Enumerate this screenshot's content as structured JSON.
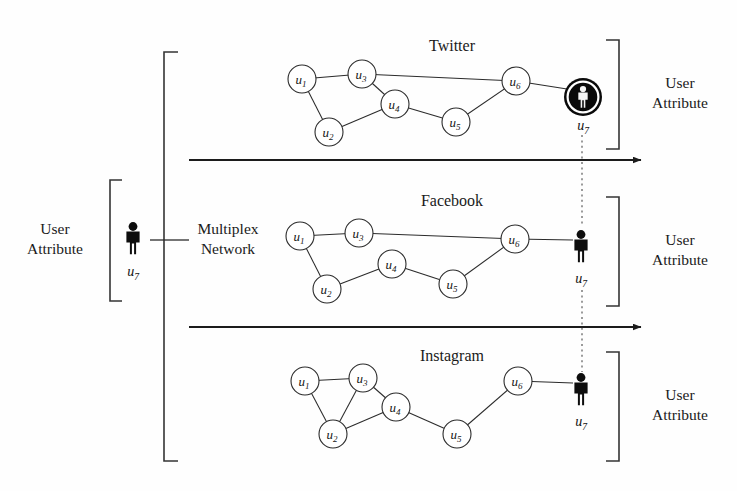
{
  "figure": {
    "kind": "multiplex-network-diagram",
    "background_color": "#fefefe",
    "ink_color": "#1a1a1a"
  },
  "left_annotation": {
    "label_line1": "User",
    "label_line2": "Attribute",
    "person_label": "u",
    "person_subscript": "7",
    "bracket": {
      "x": 110,
      "top": 180,
      "bottom": 301,
      "tip": 12,
      "opens": "right"
    }
  },
  "multiplex_annotation": {
    "label_line1": "Multiplex",
    "label_line2": "Network",
    "bracket": {
      "x": 164,
      "top": 52,
      "bottom": 461,
      "tip": 14,
      "opens": "right"
    },
    "connector": {
      "x1": 164,
      "x2": 189,
      "y": 240
    }
  },
  "layers": [
    {
      "name": "twitter",
      "title": "Twitter",
      "title_pos": {
        "x": 452,
        "y": 51
      },
      "nodes": [
        {
          "id": "u1",
          "label": "u",
          "sub": "1",
          "x": 302,
          "y": 79,
          "r": 14
        },
        {
          "id": "u2",
          "label": "u",
          "sub": "2",
          "x": 329,
          "y": 132,
          "r": 14
        },
        {
          "id": "u3",
          "label": "u",
          "sub": "3",
          "x": 362,
          "y": 74,
          "r": 14
        },
        {
          "id": "u4",
          "label": "u",
          "sub": "4",
          "x": 395,
          "y": 104,
          "r": 14
        },
        {
          "id": "u5",
          "label": "u",
          "sub": "5",
          "x": 456,
          "y": 122,
          "r": 14
        },
        {
          "id": "u6",
          "label": "u",
          "sub": "6",
          "x": 516,
          "y": 81,
          "r": 14
        }
      ],
      "edges": [
        [
          "u1",
          "u3"
        ],
        [
          "u1",
          "u2"
        ],
        [
          "u3",
          "u4"
        ],
        [
          "u3",
          "u6"
        ],
        [
          "u2",
          "u4"
        ],
        [
          "u4",
          "u5"
        ],
        [
          "u5",
          "u6"
        ]
      ],
      "person": {
        "x": 583,
        "y": 97,
        "style": "highlighted-disc",
        "label": "u",
        "subscript": "7",
        "label_y": 130,
        "edge_from": "u6"
      },
      "right_bracket": {
        "x": 619,
        "top": 40,
        "bottom": 149,
        "tip": 13,
        "opens": "left"
      },
      "right_label_line1": "User",
      "right_label_line2": "Attribute",
      "right_label_pos": {
        "x": 680,
        "y": 88
      }
    },
    {
      "name": "facebook",
      "title": "Facebook",
      "title_pos": {
        "x": 452,
        "y": 206
      },
      "nodes": [
        {
          "id": "u1",
          "label": "u",
          "sub": "1",
          "x": 300,
          "y": 236,
          "r": 14
        },
        {
          "id": "u2",
          "label": "u",
          "sub": "2",
          "x": 327,
          "y": 289,
          "r": 14
        },
        {
          "id": "u3",
          "label": "u",
          "sub": "3",
          "x": 359,
          "y": 233,
          "r": 14
        },
        {
          "id": "u4",
          "label": "u",
          "sub": "4",
          "x": 392,
          "y": 264,
          "r": 14
        },
        {
          "id": "u5",
          "label": "u",
          "sub": "5",
          "x": 453,
          "y": 284,
          "r": 14
        },
        {
          "id": "u6",
          "label": "u",
          "sub": "6",
          "x": 515,
          "y": 239,
          "r": 14
        }
      ],
      "edges": [
        [
          "u1",
          "u3"
        ],
        [
          "u1",
          "u2"
        ],
        [
          "u3",
          "u6"
        ],
        [
          "u2",
          "u4"
        ],
        [
          "u4",
          "u5"
        ],
        [
          "u5",
          "u6"
        ]
      ],
      "person": {
        "x": 581,
        "y": 248,
        "style": "silhouette",
        "label": "u",
        "subscript": "7",
        "label_y": 283,
        "edge_from": "u6"
      },
      "right_bracket": {
        "x": 619,
        "top": 197,
        "bottom": 306,
        "tip": 13,
        "opens": "left"
      },
      "right_label_line1": "User",
      "right_label_line2": "Attribute",
      "right_label_pos": {
        "x": 680,
        "y": 245
      }
    },
    {
      "name": "instagram",
      "title": "Instagram",
      "title_pos": {
        "x": 452,
        "y": 361
      },
      "nodes": [
        {
          "id": "u1",
          "label": "u",
          "sub": "1",
          "x": 305,
          "y": 381,
          "r": 14
        },
        {
          "id": "u2",
          "label": "u",
          "sub": "2",
          "x": 333,
          "y": 434,
          "r": 14
        },
        {
          "id": "u3",
          "label": "u",
          "sub": "3",
          "x": 363,
          "y": 378,
          "r": 14
        },
        {
          "id": "u4",
          "label": "u",
          "sub": "4",
          "x": 396,
          "y": 407,
          "r": 14
        },
        {
          "id": "u5",
          "label": "u",
          "sub": "5",
          "x": 457,
          "y": 434,
          "r": 14
        },
        {
          "id": "u6",
          "label": "u",
          "sub": "6",
          "x": 518,
          "y": 381,
          "r": 14
        }
      ],
      "edges": [
        [
          "u1",
          "u3"
        ],
        [
          "u1",
          "u2"
        ],
        [
          "u3",
          "u2"
        ],
        [
          "u3",
          "u4"
        ],
        [
          "u2",
          "u4"
        ],
        [
          "u4",
          "u5"
        ],
        [
          "u5",
          "u6"
        ]
      ],
      "person": {
        "x": 581,
        "y": 391,
        "style": "silhouette",
        "label": "u",
        "subscript": "7",
        "label_y": 426,
        "edge_from": "u6"
      },
      "right_bracket": {
        "x": 619,
        "top": 352,
        "bottom": 461,
        "tip": 13,
        "opens": "left"
      },
      "right_label_line1": "User",
      "right_label_line2": "Attribute",
      "right_label_pos": {
        "x": 680,
        "y": 400
      }
    }
  ],
  "flow_arrows": [
    {
      "name": "arrow-twitter-facebook",
      "x1": 189,
      "x2": 641,
      "y": 160
    },
    {
      "name": "arrow-facebook-instagram",
      "x1": 189,
      "x2": 641,
      "y": 327
    }
  ],
  "dotted_links": [
    {
      "name": "u7-link-twitter-facebook",
      "x": 582,
      "y1": 135,
      "y2": 225
    },
    {
      "name": "u7-link-facebook-instagram",
      "x": 582,
      "y1": 290,
      "y2": 372
    }
  ]
}
